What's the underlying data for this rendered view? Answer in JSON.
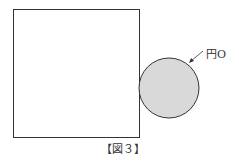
{
  "figure": {
    "caption": "【図３】",
    "circle_label": "円O",
    "colors": {
      "stroke": "#333333",
      "circle_fill": "#d9d9d9"
    }
  }
}
